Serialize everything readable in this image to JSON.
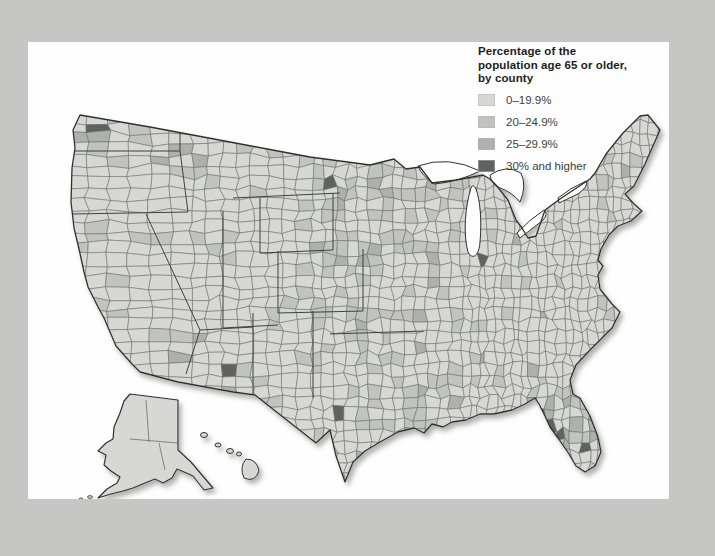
{
  "figure": {
    "kind": "choropleth-map",
    "region_shown": "United States counties (lower 48, Alaska, Hawaii)"
  },
  "legend": {
    "title_lines": [
      "Percentage of the",
      "population age 65 or older,",
      "by county"
    ],
    "items": [
      {
        "label": "0–19.9%",
        "color": "#d7d8d3"
      },
      {
        "label": "20–24.9%",
        "color": "#c1c3be"
      },
      {
        "label": "25–29.9%",
        "color": "#adb0ab"
      },
      {
        "label": "30% and higher",
        "color": "#5e625f"
      }
    ]
  },
  "map": {
    "page_background": "#c6c7c5",
    "panel_background": "#fefefe",
    "county_border_color": "#6b6d68",
    "state_border_color": "#3f413d",
    "outline_color": "#2f302e",
    "lake_fill": "#fefefe",
    "shadow_color": "#a9aaa7",
    "dark_counties": [
      {
        "area": "washington-puget-sound",
        "x": 60,
        "y": 88
      },
      {
        "area": "north-dakota-central",
        "x": 302,
        "y": 140
      },
      {
        "area": "new-mexico-southwest",
        "x": 204,
        "y": 333
      },
      {
        "area": "texas-central",
        "x": 312,
        "y": 374
      },
      {
        "area": "florida-west-coast",
        "x": 513,
        "y": 371
      },
      {
        "area": "florida-west-coast",
        "x": 521,
        "y": 380
      },
      {
        "area": "florida-west-coast",
        "x": 529,
        "y": 390
      },
      {
        "area": "florida-west-coast",
        "x": 532,
        "y": 398
      }
    ],
    "medium_counties": [
      {
        "area": "washington-coast",
        "x": 63,
        "y": 97
      },
      {
        "area": "arizona-east",
        "x": 177,
        "y": 295
      },
      {
        "area": "new-mexico-south",
        "x": 194,
        "y": 346
      },
      {
        "area": "florida-north-gulf",
        "x": 518,
        "y": 363
      },
      {
        "area": "florida-south-gulf",
        "x": 537,
        "y": 404
      },
      {
        "area": "florida-south",
        "x": 527,
        "y": 408
      }
    ]
  }
}
